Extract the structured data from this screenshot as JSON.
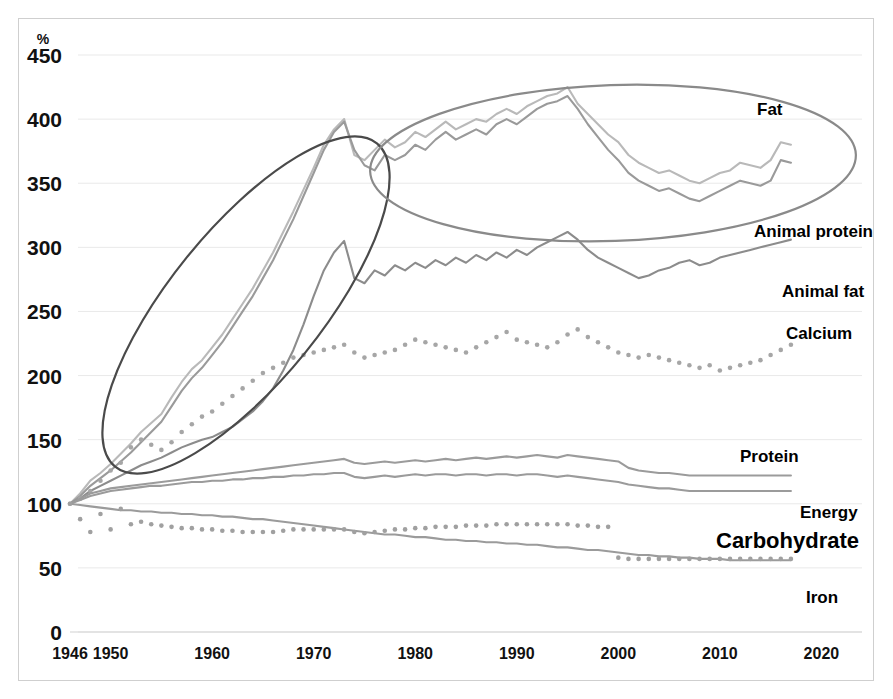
{
  "axes": {
    "unit_label": "%",
    "y_ticks": [
      0,
      50,
      100,
      150,
      200,
      250,
      300,
      350,
      400,
      450
    ],
    "x_ticks": [
      1946,
      1950,
      1960,
      1970,
      1980,
      1990,
      2000,
      2010,
      2020
    ],
    "x_tick_labels": [
      "1946",
      "1950",
      "1960",
      "1970",
      "1980",
      "1990",
      "2000",
      "2010",
      "2020"
    ],
    "y_tick_labels": [
      "0",
      "50",
      "100",
      "150",
      "200",
      "250",
      "300",
      "350",
      "400",
      "450"
    ]
  },
  "series_labels": {
    "fat": "Fat",
    "animal_protein": "Animal protein",
    "animal_fat": "Animal fat",
    "calcium": "Calcium",
    "protein": "Protein",
    "energy": "Energy",
    "carbohydrate": "Carbohydrate",
    "iron": "Iron"
  },
  "colors": {
    "fat": "#b9b9b9",
    "animal_protein": "#9a9a9a",
    "animal_fat": "#8c8c8c",
    "calcium": "#a6a6a6",
    "protein": "#9b9b9b",
    "energy": "#9b9b9b",
    "carbohydrate": "#9b9b9b",
    "iron": "#a0a0a0",
    "annotation_steep": "#4a4a4a",
    "annotation_plateau": "#8a8a8a",
    "gridline": "#e9e9e9",
    "text": "#111111",
    "frame": "#cfcfcf"
  },
  "annotations": [
    {
      "name": "steep-rise-ellipse",
      "cx": 246,
      "cy": 305,
      "rx": 208,
      "ry": 76,
      "rotate": -51
    },
    {
      "name": "plateau-ellipse",
      "cx": 613,
      "cy": 163,
      "rx": 243,
      "ry": 78,
      "rotate": -2
    }
  ],
  "chart_data": {
    "type": "line",
    "title": "",
    "xlabel": "",
    "ylabel": "%",
    "xlim": [
      1946,
      2024
    ],
    "ylim": [
      0,
      450
    ],
    "grid": true,
    "legend": "right-inline-labels",
    "note": "Index values, 1946 = 100. All series start at 100 in 1946.",
    "x": [
      1946,
      1947,
      1948,
      1949,
      1950,
      1951,
      1952,
      1953,
      1954,
      1955,
      1956,
      1957,
      1958,
      1959,
      1960,
      1961,
      1962,
      1963,
      1964,
      1965,
      1966,
      1967,
      1968,
      1969,
      1970,
      1971,
      1972,
      1973,
      1974,
      1975,
      1976,
      1977,
      1978,
      1979,
      1980,
      1981,
      1982,
      1983,
      1984,
      1985,
      1986,
      1987,
      1988,
      1989,
      1990,
      1991,
      1992,
      1993,
      1994,
      1995,
      1996,
      1997,
      1998,
      1999,
      2000,
      2001,
      2002,
      2003,
      2004,
      2005,
      2006,
      2007,
      2008,
      2009,
      2010,
      2011,
      2012,
      2013,
      2014,
      2015,
      2016,
      2017
    ],
    "series": [
      {
        "name": "Fat",
        "style": "solid",
        "color": "#b9b9b9",
        "values": [
          100,
          108,
          118,
          124,
          131,
          139,
          147,
          156,
          163,
          170,
          183,
          195,
          205,
          212,
          222,
          232,
          244,
          256,
          268,
          282,
          296,
          312,
          328,
          345,
          362,
          380,
          392,
          400,
          372,
          368,
          376,
          384,
          378,
          382,
          390,
          386,
          392,
          398,
          392,
          396,
          400,
          398,
          404,
          408,
          404,
          410,
          414,
          418,
          420,
          425,
          412,
          404,
          396,
          388,
          382,
          372,
          366,
          362,
          358,
          360,
          356,
          352,
          350,
          354,
          358,
          360,
          366,
          364,
          362,
          368,
          382,
          380
        ]
      },
      {
        "name": "Animal protein",
        "style": "solid",
        "color": "#9a9a9a",
        "values": [
          100,
          106,
          114,
          120,
          126,
          133,
          140,
          148,
          156,
          164,
          176,
          188,
          198,
          206,
          216,
          226,
          238,
          250,
          262,
          276,
          290,
          306,
          322,
          340,
          358,
          376,
          390,
          398,
          376,
          364,
          360,
          372,
          368,
          372,
          380,
          376,
          384,
          390,
          384,
          388,
          392,
          388,
          396,
          400,
          396,
          402,
          408,
          412,
          414,
          418,
          408,
          396,
          386,
          376,
          368,
          358,
          352,
          348,
          344,
          346,
          342,
          338,
          336,
          340,
          344,
          348,
          352,
          350,
          348,
          352,
          368,
          366
        ]
      },
      {
        "name": "Animal fat",
        "style": "solid",
        "color": "#8c8c8c",
        "values": [
          100,
          104,
          110,
          114,
          118,
          122,
          126,
          130,
          133,
          136,
          140,
          144,
          147,
          150,
          152,
          156,
          160,
          166,
          172,
          180,
          190,
          204,
          220,
          240,
          262,
          282,
          296,
          305,
          276,
          272,
          282,
          278,
          286,
          282,
          288,
          284,
          290,
          286,
          292,
          288,
          294,
          290,
          296,
          292,
          298,
          294,
          300,
          304,
          308,
          312,
          306,
          298,
          292,
          288,
          284,
          280,
          276,
          278,
          282,
          284,
          288,
          290,
          286,
          288,
          292,
          294,
          296,
          298,
          300,
          302,
          304,
          306
        ]
      },
      {
        "name": "Calcium",
        "style": "dotted",
        "color": "#a6a6a6",
        "values": [
          100,
          104,
          110,
          118,
          126,
          132,
          144,
          150,
          146,
          142,
          148,
          156,
          162,
          168,
          172,
          178,
          184,
          190,
          196,
          202,
          206,
          210,
          214,
          216,
          218,
          220,
          222,
          224,
          218,
          214,
          216,
          218,
          220,
          224,
          228,
          226,
          224,
          222,
          220,
          218,
          222,
          226,
          230,
          234,
          228,
          226,
          224,
          222,
          226,
          232,
          236,
          230,
          226,
          222,
          218,
          216,
          214,
          216,
          214,
          212,
          210,
          208,
          206,
          208,
          204,
          206,
          208,
          210,
          212,
          216,
          220,
          224
        ]
      },
      {
        "name": "Protein",
        "style": "solid",
        "color": "#9b9b9b",
        "values": [
          100,
          104,
          108,
          110,
          112,
          113,
          114,
          115,
          116,
          117,
          118,
          119,
          120,
          121,
          122,
          123,
          124,
          125,
          126,
          127,
          128,
          129,
          130,
          131,
          132,
          133,
          134,
          135,
          132,
          131,
          132,
          133,
          132,
          133,
          134,
          133,
          134,
          135,
          134,
          135,
          136,
          135,
          136,
          137,
          136,
          137,
          138,
          137,
          136,
          138,
          137,
          136,
          135,
          134,
          133,
          128,
          126,
          125,
          124,
          124,
          123,
          122,
          122,
          122,
          122,
          122,
          122,
          122,
          122,
          122,
          122,
          122
        ]
      },
      {
        "name": "Energy",
        "style": "solid",
        "color": "#9b9b9b",
        "values": [
          100,
          103,
          106,
          108,
          110,
          111,
          112,
          113,
          114,
          114,
          115,
          116,
          117,
          117,
          118,
          118,
          119,
          119,
          120,
          120,
          121,
          121,
          122,
          122,
          123,
          123,
          124,
          124,
          121,
          120,
          121,
          122,
          121,
          122,
          123,
          122,
          123,
          123,
          122,
          123,
          123,
          122,
          123,
          123,
          122,
          123,
          123,
          122,
          121,
          122,
          121,
          120,
          119,
          118,
          117,
          115,
          114,
          113,
          112,
          112,
          111,
          110,
          110,
          110,
          110,
          110,
          110,
          110,
          110,
          110,
          110,
          110
        ]
      },
      {
        "name": "Carbohydrate",
        "style": "solid",
        "color": "#9b9b9b",
        "values": [
          100,
          99,
          98,
          97,
          96,
          95,
          95,
          94,
          94,
          93,
          93,
          92,
          92,
          91,
          91,
          90,
          90,
          89,
          88,
          88,
          87,
          86,
          85,
          84,
          83,
          82,
          81,
          80,
          79,
          78,
          77,
          76,
          76,
          75,
          74,
          74,
          73,
          72,
          72,
          71,
          71,
          70,
          70,
          69,
          69,
          68,
          68,
          67,
          66,
          66,
          65,
          64,
          64,
          63,
          62,
          61,
          60,
          60,
          59,
          59,
          58,
          58,
          57,
          57,
          57,
          56,
          56,
          56,
          56,
          56,
          56,
          56
        ]
      },
      {
        "name": "Iron",
        "style": "dotted",
        "color": "#a0a0a0",
        "values": [
          100,
          88,
          78,
          92,
          80,
          96,
          84,
          86,
          84,
          83,
          82,
          81,
          81,
          80,
          80,
          79,
          79,
          78,
          78,
          78,
          78,
          79,
          80,
          80,
          80,
          80,
          80,
          80,
          78,
          77,
          78,
          79,
          80,
          80,
          81,
          81,
          82,
          82,
          82,
          83,
          83,
          83,
          84,
          84,
          84,
          84,
          84,
          84,
          84,
          84,
          83,
          83,
          82,
          82,
          58,
          57,
          57,
          57,
          57,
          57,
          57,
          57,
          57,
          57,
          57,
          57,
          57,
          57,
          57,
          57,
          57,
          57
        ]
      }
    ]
  }
}
